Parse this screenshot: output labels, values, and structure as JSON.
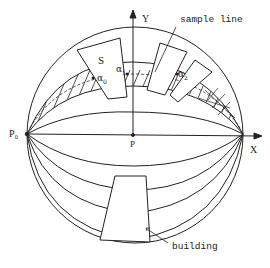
{
  "figure": {
    "type": "hemispherical sky-dome projection diagram",
    "stroke_color": "#222222",
    "background": "#ffffff"
  },
  "axes": {
    "x_label": "X",
    "y_label": "Y",
    "origin_label": "P",
    "left_point_label": "P₀"
  },
  "labels": {
    "sample_line": "sample line",
    "building": "building",
    "sky_patch": "S"
  },
  "alpha_points": [
    {
      "symbol": "α",
      "sub": "0"
    },
    {
      "symbol": "α",
      "sub": "1"
    },
    {
      "symbol": "α",
      "sub": "2"
    }
  ]
}
